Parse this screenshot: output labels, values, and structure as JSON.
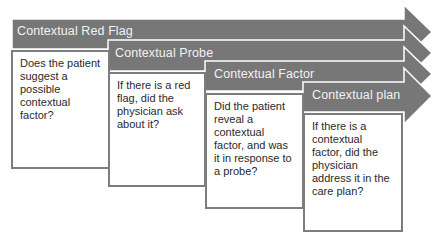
{
  "colors": {
    "band_fill": "#777777",
    "band_outline": "#ffffff",
    "box_border": "#7d7d7d",
    "box_text": "#2a2a2a",
    "band_text": "#f2f2f2"
  },
  "steps": [
    {
      "label": "Contextual Red Flag",
      "question": "Does the patient suggest a possible contextual factor?"
    },
    {
      "label": "Contextual Probe",
      "question": "If there is a red flag, did the physician ask about it?"
    },
    {
      "label": "Contextual Factor",
      "question": "Did the patient reveal a contextual factor, and was it in response to a probe?"
    },
    {
      "label": "Contextual plan",
      "question": "If there is a contextual factor, did the physician address it in the care plan?"
    }
  ]
}
